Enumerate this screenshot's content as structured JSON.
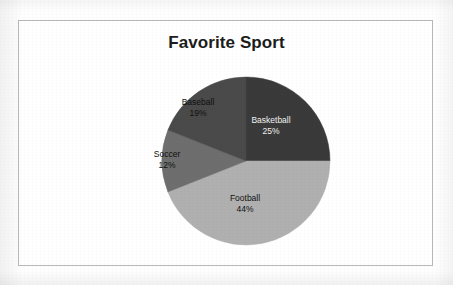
{
  "chart": {
    "title": "Favorite Sport",
    "frame_border_color": "#b9b9b9",
    "background_color": "#ffffff"
  },
  "chart_data": {
    "type": "pie",
    "title": "Favorite Sport",
    "xlabel": "",
    "ylabel": "",
    "legend": "none",
    "grid": false,
    "start_angle_deg": 0,
    "direction": "clockwise",
    "categories": [
      "Basketball",
      "Football",
      "Soccer",
      "Baseball"
    ],
    "values": [
      25,
      44,
      12,
      19
    ],
    "units": "percent",
    "total": 100,
    "slices": [
      {
        "label": "Basketball",
        "value": 25,
        "value_text": "25%",
        "color": "#3a3a3a",
        "label_color": "#f2f2f2",
        "start_deg": 0,
        "end_deg": 90
      },
      {
        "label": "Football",
        "value": 44,
        "value_text": "44%",
        "color": "#b0b0b0",
        "label_color": "#101010",
        "start_deg": 90,
        "end_deg": 248.4
      },
      {
        "label": "Soccer",
        "value": 12,
        "value_text": "12%",
        "color": "#6e6e6e",
        "label_color": "#101010",
        "start_deg": 248.4,
        "end_deg": 291.6
      },
      {
        "label": "Baseball",
        "value": 19,
        "value_text": "19%",
        "color": "#4a4a4a",
        "label_color": "#101010",
        "start_deg": 291.6,
        "end_deg": 360
      }
    ]
  }
}
